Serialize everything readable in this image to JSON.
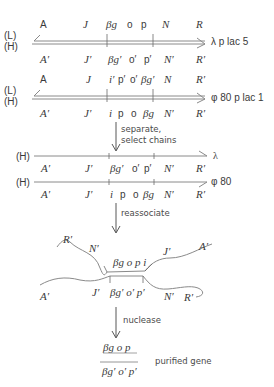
{
  "figure": {
    "panel1": {
      "strand_labels": {
        "top": "(L)",
        "bottom": "(H)"
      },
      "name": "λ p lac 5",
      "top_genes": [
        "A",
        "J",
        "βg",
        "o",
        "p",
        "N",
        "R"
      ],
      "bottom_genes": [
        "A′",
        "J′",
        "βg′",
        "o′",
        "p′",
        "N′",
        "R′"
      ]
    },
    "panel2": {
      "strand_labels": {
        "top": "(L)",
        "bottom": "(H)"
      },
      "name": "φ 80 p lac 1",
      "top_genes": [
        "A",
        "J",
        "i′",
        "p′",
        "o′",
        "βg′",
        "N",
        "R′"
      ],
      "bottom_genes": [
        "A′",
        "J′",
        "i",
        "p",
        "o",
        "βg",
        "N′",
        "R′"
      ]
    },
    "step1": {
      "line1": "separate,",
      "line2": "select chains"
    },
    "panel3": {
      "strand_label": "(H)",
      "name": "λ",
      "genes": [
        "A′",
        "J′",
        "βg′",
        "o′",
        "p′",
        "N′",
        "R′"
      ]
    },
    "panel4": {
      "strand_label": "(H)",
      "name": "φ 80",
      "genes": [
        "A′",
        "J′",
        "i",
        "p",
        "o",
        "βg",
        "N′",
        "R′"
      ]
    },
    "step2": {
      "label": "reassociate"
    },
    "heteroduplex": {
      "upper_genes": [
        "R′",
        "N′",
        "βg o p i",
        "J′",
        "A′"
      ],
      "lower_genes": [
        "A′",
        "J′",
        "βg′ o′ p′",
        "N′",
        "R′"
      ]
    },
    "step3": {
      "label": "nuclease"
    },
    "result": {
      "top": "βg  o  p",
      "bottom": "βg′ o′ p′",
      "caption": "purified gene"
    }
  }
}
